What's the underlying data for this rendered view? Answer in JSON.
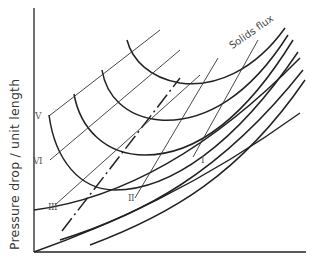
{
  "diagram": {
    "y_axis_label": "Pressure drop / unit length",
    "x_axis_label": "",
    "curve_family_label": "Solids flux",
    "line_labels": {
      "I": "I",
      "II": "II",
      "III": "III",
      "V": "V",
      "VI": "VI"
    },
    "colors": {
      "curve": "#222222",
      "thin_line": "#333333",
      "background": "#ffffff"
    }
  }
}
